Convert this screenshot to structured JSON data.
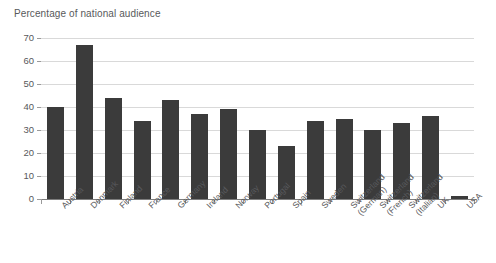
{
  "chart_data": {
    "type": "bar",
    "title": "Percentage of national audience",
    "xlabel": "",
    "ylabel": "",
    "ylim": [
      0,
      70
    ],
    "yticks": [
      0,
      10,
      20,
      30,
      40,
      50,
      60,
      70
    ],
    "grid": true,
    "legend": false,
    "orientation": "vertical",
    "bar_color": "#3b3b3b",
    "gridline_color": "#d9d9d9",
    "axis_color": "#7d7d7d",
    "text_color": "#58595b",
    "background": "#ffffff",
    "xtick_rotation": -45,
    "categories": [
      "Austria",
      "Denmark",
      "Finland",
      "France",
      "Germany",
      "Ireland",
      "Norway",
      "Portugal",
      "Spain",
      "Sweden",
      "Switzerland (German)",
      "Switzerland (French)",
      "Switzerland (Italian)",
      "UK",
      "USA"
    ],
    "category_lines": [
      [
        "Austria"
      ],
      [
        "Denmark"
      ],
      [
        "Finland"
      ],
      [
        "France"
      ],
      [
        "Germany"
      ],
      [
        "Ireland"
      ],
      [
        "Norway"
      ],
      [
        "Portugal"
      ],
      [
        "Spain"
      ],
      [
        "Sweden"
      ],
      [
        "Switzerland",
        "(German)"
      ],
      [
        "Switzerland",
        "(French)"
      ],
      [
        "Switzerland",
        "(Italian)"
      ],
      [
        "UK"
      ],
      [
        "USA"
      ]
    ],
    "values": [
      40,
      67,
      44,
      34,
      43,
      37,
      39,
      30,
      23,
      34,
      35,
      30,
      33,
      36,
      1.5
    ]
  }
}
